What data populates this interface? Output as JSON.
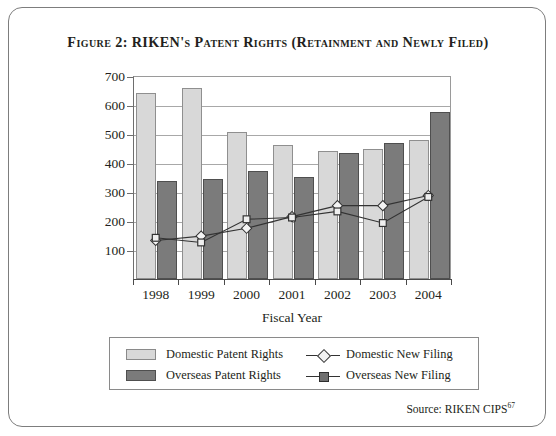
{
  "figure": {
    "title": "Figure 2: RIKEN's Patent Rights (Retainment and Newly Filed)",
    "source_label": "Source: RIKEN CIPS",
    "source_footnote": "67"
  },
  "legend": {
    "entries": [
      {
        "label": "Domestic Patent Rights",
        "kind": "bar",
        "color": "#d8d8d8"
      },
      {
        "label": "Overseas Patent Rights",
        "kind": "bar",
        "color": "#7b7b7b"
      },
      {
        "label": "Domestic New Filing",
        "kind": "line-diamond",
        "color": "#333333"
      },
      {
        "label": "Overseas New Filing",
        "kind": "line-square",
        "color": "#333333"
      }
    ]
  },
  "chart_data": {
    "type": "bar",
    "title": "Figure 2: RIKEN's Patent Rights (Retainment and Newly Filed)",
    "xlabel": "Fiscal Year",
    "ylabel": "",
    "categories": [
      "1998",
      "1999",
      "2000",
      "2001",
      "2002",
      "2003",
      "2004"
    ],
    "ylim": [
      0,
      700
    ],
    "yticks": [
      100,
      200,
      300,
      400,
      500,
      600,
      700
    ],
    "grid": true,
    "legend_position": "below",
    "series": [
      {
        "name": "Domestic Patent Rights",
        "type": "bar",
        "color": "#d8d8d8",
        "values": [
          640,
          660,
          508,
          462,
          443,
          447,
          481
        ]
      },
      {
        "name": "Overseas Patent Rights",
        "type": "bar",
        "color": "#7b7b7b",
        "values": [
          337,
          345,
          372,
          353,
          433,
          468,
          577
        ]
      },
      {
        "name": "Domestic New Filing",
        "type": "line",
        "marker": "diamond",
        "color": "#333333",
        "values": [
          133,
          148,
          175,
          215,
          253,
          253,
          288
        ]
      },
      {
        "name": "Overseas New Filing",
        "type": "line",
        "marker": "square",
        "color": "#333333",
        "values": [
          142,
          126,
          206,
          212,
          233,
          193,
          283
        ]
      }
    ]
  }
}
